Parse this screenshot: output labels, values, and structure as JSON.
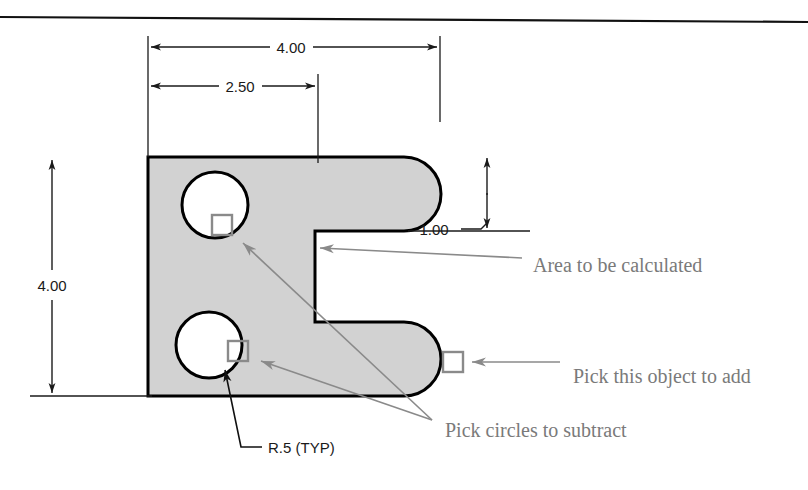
{
  "page": {
    "width": 808,
    "height": 490,
    "background_color": "#ffffff",
    "top_rule": true
  },
  "drawing": {
    "title": "C-shaped bracket area calculation exercise",
    "part_fill_color": "#d2d2d2",
    "part_outline_color": "#000000",
    "annotation_color": "#7a7a7a",
    "dimension_color": "#1a1a1a",
    "pick_box_color": "#8a8a8a"
  },
  "dimensions": [
    {
      "id": "overall-width",
      "label": "4.00",
      "orientation": "horizontal",
      "x": 291,
      "y": 47
    },
    {
      "id": "notch-offset",
      "label": "2.50",
      "orientation": "horizontal",
      "x": 240,
      "y": 86
    },
    {
      "id": "arm-height",
      "label": "1.00",
      "orientation": "vertical-leader",
      "x": 442,
      "y": 229
    },
    {
      "id": "overall-height",
      "label": "4.00",
      "orientation": "vertical",
      "x": 52,
      "y": 285
    }
  ],
  "callouts": [
    {
      "id": "radius-note",
      "label": "R.5  (TYP)",
      "style": "dimension",
      "x": 268,
      "y": 452
    },
    {
      "id": "area-note",
      "label": "Area to be calculated",
      "style": "annotation",
      "x": 533,
      "y": 265
    },
    {
      "id": "add-object-note",
      "label": "Pick this object to add",
      "style": "annotation",
      "x": 573,
      "y": 376
    },
    {
      "id": "subtract-circles-note",
      "label": "Pick circles to subtract",
      "style": "annotation",
      "x": 445,
      "y": 430
    }
  ],
  "features": {
    "circles": [
      {
        "id": "upper-hole",
        "cx": 215,
        "cy": 205,
        "r": 33
      },
      {
        "id": "lower-hole",
        "cx": 209,
        "cy": 345,
        "r": 33
      }
    ],
    "pick_boxes": [
      {
        "id": "pick-upper-circle",
        "x": 212,
        "y": 215,
        "size": 20
      },
      {
        "id": "pick-lower-circle",
        "x": 228,
        "y": 341,
        "size": 20
      },
      {
        "id": "pick-arm-object",
        "x": 443,
        "y": 352,
        "size": 20
      }
    ]
  }
}
